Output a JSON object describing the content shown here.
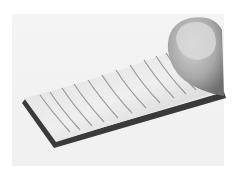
{
  "image": {
    "subject": "finger pressing a flexible grooved metallic strip",
    "alt": "Grayscale photo of a thin flexible metal strip with parallel grooves, bent upward and held by a fingertip",
    "colors": {
      "background": "#ffffff",
      "backdrop": "#f2f2f2",
      "strip_light": "#e6e6e6",
      "strip_mid": "#c8c8c8",
      "strip_edge": "#3a3a3a",
      "groove": "#9a9a9a",
      "finger_light": "#d0d0d0",
      "finger_dark": "#7a7a7a"
    },
    "groove_count": 11
  }
}
